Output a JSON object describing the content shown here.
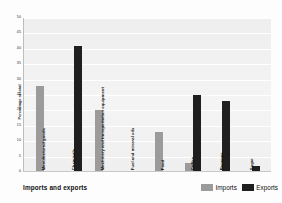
{
  "chart_data": {
    "type": "bar",
    "title": "",
    "xlabel": "",
    "ylabel": "Percentage of total",
    "ylim": [
      0,
      50
    ],
    "yticks": [
      0,
      5,
      10,
      15,
      20,
      25,
      30,
      35,
      40,
      45,
      50
    ],
    "grid": true,
    "legend_position": "bottom-right",
    "categories": [
      "Manufactured goods",
      "Chemicals",
      "Machinery and transportation equipment",
      "Fuel and mineral oils",
      "Food",
      "Coffee",
      "Bananas",
      "Sugar"
    ],
    "series": [
      {
        "name": "Imports",
        "color": "#9b9b9b",
        "values": [
          28,
          0,
          20,
          0,
          13,
          3,
          0,
          0
        ]
      },
      {
        "name": "Exports",
        "color": "#1f1f1f",
        "values": [
          0,
          41,
          0,
          0,
          0,
          25,
          23,
          2
        ]
      }
    ]
  },
  "axis": {
    "y_title": "Percentage of total",
    "ticks": [
      "50",
      "45",
      "40",
      "35",
      "30",
      "25",
      "20",
      "15",
      "10",
      "5",
      "0"
    ]
  },
  "legend": {
    "title": "Imports and exports",
    "entries": [
      {
        "label": "Imports",
        "color": "#9b9b9b"
      },
      {
        "label": "Exports",
        "color": "#1f1f1f"
      }
    ]
  }
}
